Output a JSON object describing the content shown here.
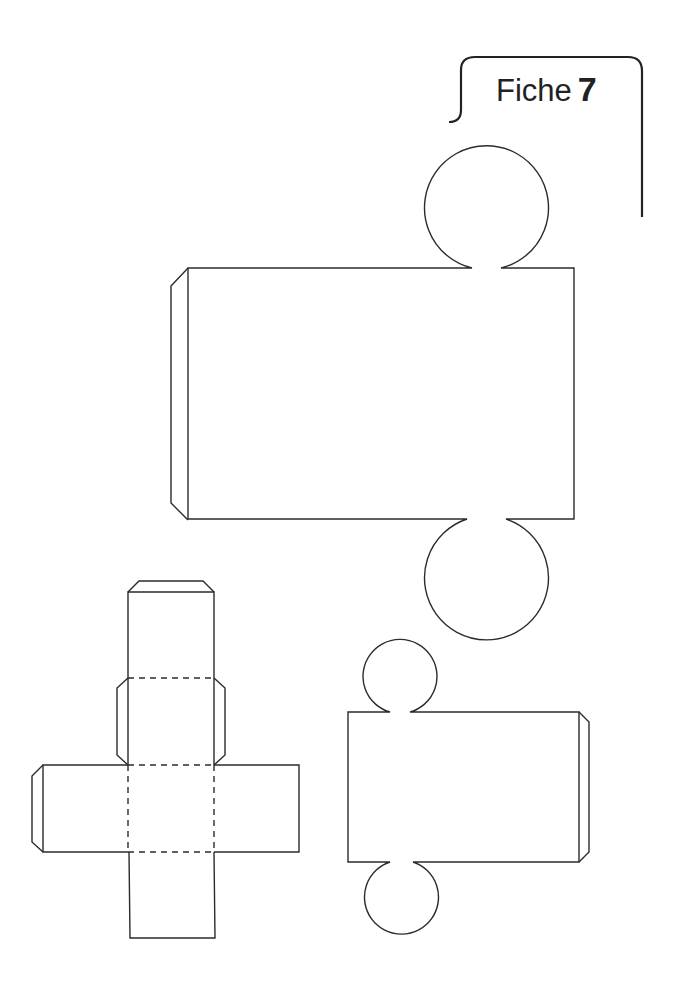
{
  "header": {
    "label": "Fiche",
    "number": "7"
  },
  "nets": [
    {
      "name": "large-cylinder-net",
      "parts": [
        "top-circle",
        "rectangle",
        "glue-tab-left",
        "bottom-circle"
      ]
    },
    {
      "name": "cube-net",
      "parts": [
        "top-glue-tab",
        "square-1",
        "side-glue-tabs",
        "square-2",
        "left-arm",
        "center-square",
        "right-arm",
        "bottom-square",
        "left-arm-glue-tab"
      ]
    },
    {
      "name": "small-cylinder-net",
      "parts": [
        "top-circle",
        "rectangle",
        "glue-tab-right",
        "bottom-circle"
      ]
    }
  ],
  "colors": {
    "line": "#2b2b2b",
    "background": "#ffffff"
  }
}
